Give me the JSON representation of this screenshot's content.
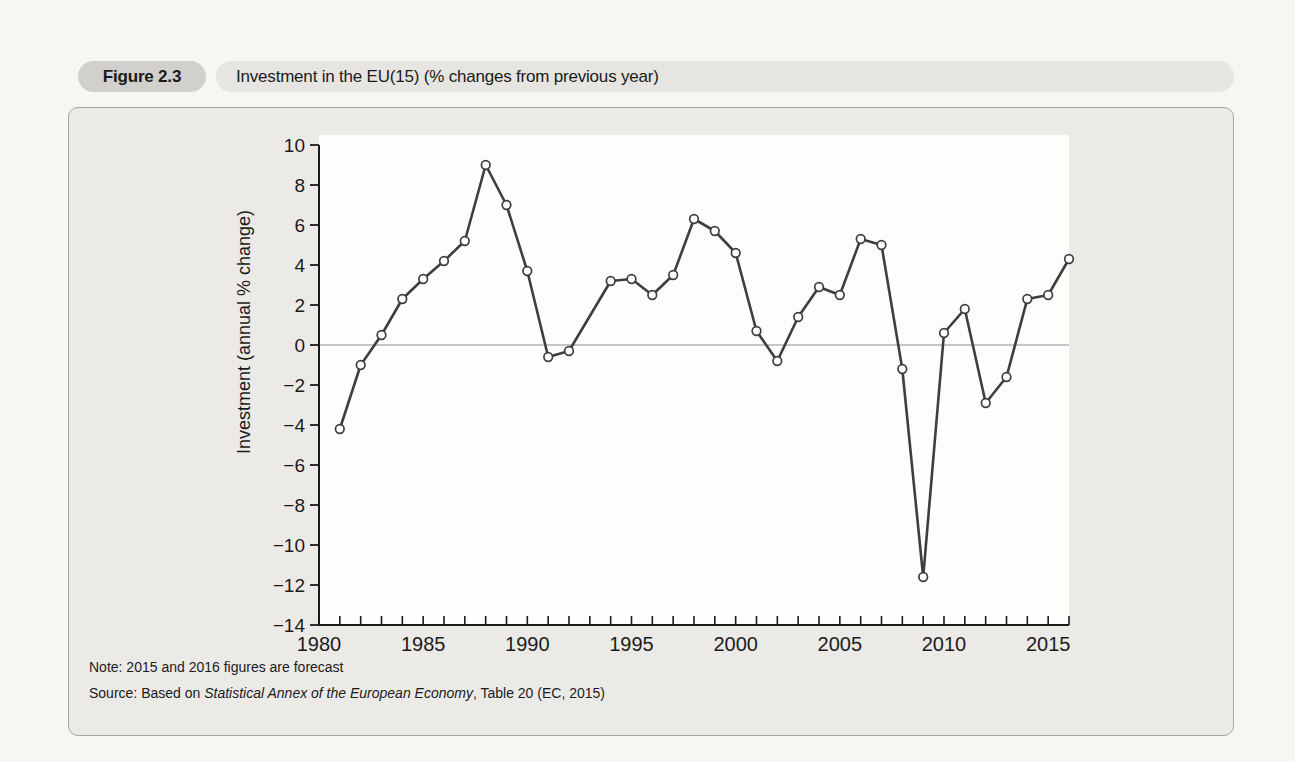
{
  "figure": {
    "label": "Figure 2.3",
    "title": "Investment in the EU(15) (% changes from previous year)",
    "note": "Note: 2015 and 2016 figures are forecast",
    "source_prefix": "Source: Based on ",
    "source_italic": "Statistical Annex of the European Economy",
    "source_suffix": ", Table 20 (EC, 2015)"
  },
  "chart_data": {
    "type": "line",
    "title": "Investment in the EU(15) (% changes from previous year)",
    "xlabel": "",
    "ylabel": "Investment (annual % change)",
    "xlim": [
      1980,
      2016
    ],
    "ylim": [
      -14,
      10
    ],
    "x_major_ticks": [
      1980,
      1985,
      1990,
      1995,
      2000,
      2005,
      2010,
      2015
    ],
    "x_minor_tick_every_years": 1,
    "y_ticks": [
      10,
      8,
      6,
      4,
      2,
      0,
      -2,
      -4,
      -6,
      -8,
      -10,
      -12,
      -14
    ],
    "zero_line": true,
    "grid": false,
    "legend": "none",
    "marker": "open-circle",
    "gap_years_without_marker": [
      1993
    ],
    "series": [
      {
        "name": "Investment (annual % change)",
        "points": [
          [
            1981,
            -4.2
          ],
          [
            1982,
            -1.0
          ],
          [
            1983,
            0.5
          ],
          [
            1984,
            2.3
          ],
          [
            1985,
            3.3
          ],
          [
            1986,
            4.2
          ],
          [
            1987,
            5.2
          ],
          [
            1988,
            9.0
          ],
          [
            1989,
            7.0
          ],
          [
            1990,
            3.7
          ],
          [
            1991,
            -0.6
          ],
          [
            1992,
            -0.3
          ],
          [
            1994,
            3.2
          ],
          [
            1995,
            3.3
          ],
          [
            1996,
            2.5
          ],
          [
            1997,
            3.5
          ],
          [
            1998,
            6.3
          ],
          [
            1999,
            5.7
          ],
          [
            2000,
            4.6
          ],
          [
            2001,
            0.7
          ],
          [
            2002,
            -0.8
          ],
          [
            2003,
            1.4
          ],
          [
            2004,
            2.9
          ],
          [
            2005,
            2.5
          ],
          [
            2006,
            5.3
          ],
          [
            2007,
            5.0
          ],
          [
            2008,
            -1.2
          ],
          [
            2009,
            -11.6
          ],
          [
            2010,
            0.6
          ],
          [
            2011,
            1.8
          ],
          [
            2012,
            -2.9
          ],
          [
            2013,
            -1.6
          ],
          [
            2014,
            2.3
          ],
          [
            2015,
            2.5
          ],
          [
            2016,
            4.3
          ]
        ]
      }
    ],
    "colors": {
      "line": "#3e3e3e",
      "marker_fill": "#ffffff",
      "axis": "#1a1a1a",
      "zero_line": "#8f8f8f",
      "plot_background": "#fdfdfc",
      "panel_background": "#eceae7",
      "tick_text": "#1b1b1b"
    }
  }
}
